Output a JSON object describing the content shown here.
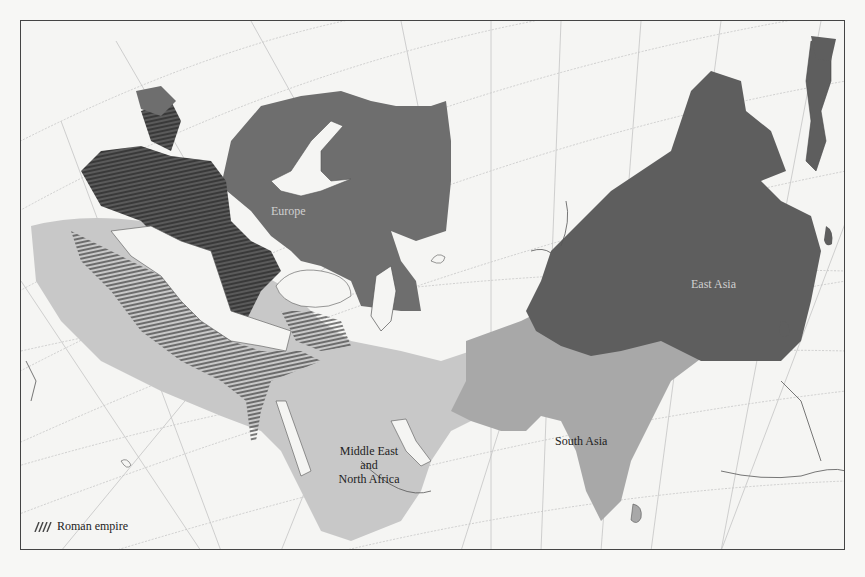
{
  "map": {
    "regions": [
      {
        "id": "europe",
        "label": "Europe",
        "fill": "#6e6e6e",
        "label_color": "#d8d8d8"
      },
      {
        "id": "east-asia",
        "label": "East Asia",
        "fill": "#5e5e5e",
        "label_color": "#d8d8d8"
      },
      {
        "id": "south-asia",
        "label": "South Asia",
        "fill": "#a8a8a8",
        "label_color": "#222222"
      },
      {
        "id": "middle-east-north-africa",
        "label_lines": [
          "Middle East",
          "and",
          "North Africa"
        ],
        "fill": "#c8c8c8",
        "label_color": "#222222"
      }
    ],
    "overlay": {
      "id": "roman-empire",
      "label": "Roman empire",
      "pattern": "hatched"
    },
    "colors": {
      "background": "#f5f5f3",
      "graticule": "#bdbdbd",
      "coast": "#555555",
      "border": "#444444"
    }
  },
  "legend": {
    "items": [
      {
        "swatch": "hatch",
        "label": "Roman empire"
      }
    ]
  }
}
